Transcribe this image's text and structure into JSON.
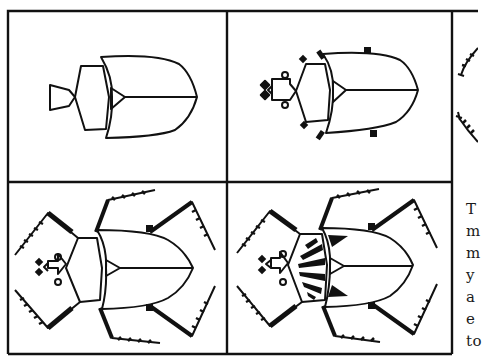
{
  "figure": {
    "panels": [
      {
        "id": "step-1",
        "label": "Basic body shapes: head, thorax, wing cases"
      },
      {
        "id": "step-2",
        "label": "Add antennae, eyes and leg stubs"
      },
      {
        "id": "step-3",
        "label": "Partial view: serrated legs (cropped)"
      },
      {
        "id": "step-4",
        "label": "Add serrated legs"
      },
      {
        "id": "step-5",
        "label": "Add black decorative markings"
      }
    ]
  },
  "caption": {
    "lines": [
      "T",
      "m",
      "m",
      "y",
      "a",
      "e",
      "to"
    ]
  },
  "colors": {
    "ink": "#111111",
    "paper": "#ffffff"
  }
}
